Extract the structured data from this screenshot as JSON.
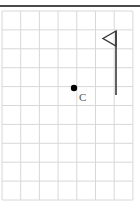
{
  "figure": {
    "background_color": "#ffffff",
    "width": 140,
    "height": 215
  },
  "top_rule": {
    "name": "top-border-rule",
    "color": "#4a4a4a",
    "y": 5,
    "thickness": 2
  },
  "grid": {
    "line_color": "#d8d8d8",
    "line_width": 1,
    "columns": 7,
    "rows": 10,
    "x_start": 2,
    "y_start": 11,
    "cell_width": 18.7,
    "cell_height": 18.9,
    "x_lines": [
      2,
      20.7,
      39.4,
      58.1,
      76.8,
      95.5,
      114.2,
      132.9
    ],
    "y_lines": [
      11,
      29.9,
      48.8,
      67.7,
      86.6,
      105.5,
      124.4,
      143.3,
      162.2,
      181.1,
      200
    ]
  },
  "points": [
    {
      "id": "C",
      "label": "C",
      "label_color": "#555555",
      "dot_color": "#000000",
      "x": 74,
      "y": 88,
      "radius": 3.2,
      "label_x": 79,
      "label_y": 92
    }
  ],
  "flag": {
    "name": "flag",
    "color": "#3a3a3a",
    "pole": {
      "x": 116,
      "y_top": 31,
      "y_bottom": 95,
      "width": 1.6
    },
    "pennant": {
      "direction": "left",
      "tip_x": 103,
      "tip_y": 38.5,
      "top_x": 116,
      "top_y": 31,
      "bottom_x": 116,
      "bottom_y": 46,
      "fill": "none",
      "stroke_width": 1.4
    }
  }
}
